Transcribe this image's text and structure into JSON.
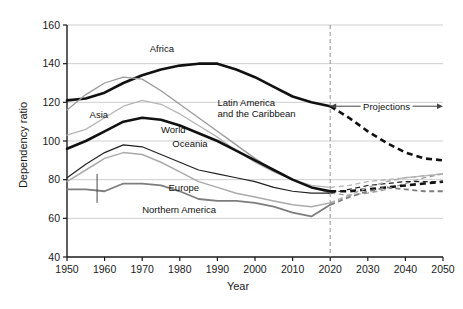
{
  "chart_data": {
    "type": "line",
    "title": "",
    "xlabel": "Year",
    "ylabel": "Dependency ratio",
    "xlim": [
      1950,
      2050
    ],
    "ylim": [
      40,
      160
    ],
    "xticks": [
      1950,
      1960,
      1970,
      1980,
      1990,
      2000,
      2010,
      2020,
      2030,
      2040,
      2050
    ],
    "yticks": [
      40,
      60,
      80,
      100,
      120,
      140,
      160
    ],
    "grid": "horizontal",
    "legend_position": "inline-labels",
    "projection_start": 2020,
    "annotations": [
      {
        "name": "projections-span",
        "text": "Projections",
        "from": 2020,
        "to": 2050,
        "y": 118,
        "arrow": "double"
      }
    ],
    "x": [
      1950,
      1955,
      1960,
      1965,
      1970,
      1975,
      1980,
      1985,
      1990,
      1995,
      2000,
      2005,
      2010,
      2015,
      2020,
      2025,
      2030,
      2035,
      2040,
      2045,
      2050
    ],
    "series": [
      {
        "name": "Africa",
        "label": "Africa",
        "color": "#111111",
        "width": 2.6,
        "label_x": 1972,
        "label_y": 146,
        "values": [
          121,
          122,
          125,
          130,
          134,
          137,
          139,
          140,
          140,
          137,
          133,
          128,
          123,
          120,
          118,
          112,
          105,
          99,
          94,
          91,
          90
        ]
      },
      {
        "name": "Latin America and the Caribbean",
        "label": "Latin America\nand the Caribbean",
        "color": "#9a9a9a",
        "width": 1.3,
        "label_x": 1990,
        "label_y": 118,
        "values": [
          116,
          124,
          130,
          133,
          132,
          126,
          119,
          112,
          105,
          98,
          91,
          85,
          80,
          76,
          73,
          72,
          73,
          75,
          78,
          81,
          83
        ]
      },
      {
        "name": "Asia",
        "label": "Asia",
        "color": "#b5b5b5",
        "width": 1.3,
        "label_x": 1956,
        "label_y": 112,
        "values": [
          103,
          106,
          112,
          118,
          121,
          119,
          114,
          108,
          102,
          95,
          89,
          84,
          80,
          77,
          76,
          77,
          79,
          80,
          81,
          82,
          83
        ]
      },
      {
        "name": "World",
        "label": "World",
        "color": "#111111",
        "width": 2.6,
        "label_x": 1975,
        "label_y": 104,
        "values": [
          96,
          100,
          105,
          110,
          112,
          111,
          108,
          104,
          100,
          95,
          90,
          85,
          80,
          76,
          74,
          74,
          75,
          76,
          77,
          78,
          79
        ]
      },
      {
        "name": "Oceania",
        "label": "Oceania",
        "color": "#222222",
        "width": 1.2,
        "label_x": 1978,
        "label_y": 97,
        "values": [
          81,
          88,
          94,
          98,
          97,
          93,
          89,
          85,
          83,
          81,
          79,
          76,
          74,
          73,
          73,
          75,
          77,
          78,
          79,
          79,
          79
        ]
      },
      {
        "name": "Europe",
        "label": "Europe",
        "color": "#aaaaaa",
        "width": 1.5,
        "label_x": 1977,
        "label_y": 74,
        "values": [
          79,
          85,
          91,
          94,
          93,
          89,
          84,
          79,
          76,
          73,
          71,
          69,
          67,
          66,
          68,
          72,
          76,
          79,
          81,
          82,
          83
        ]
      },
      {
        "name": "Northern America",
        "label": "Northern America",
        "color": "#7d7d7d",
        "width": 1.8,
        "label_x": 1970,
        "label_y": 63,
        "leader": {
          "x": 1958,
          "y_from": 68,
          "y_to": 83
        },
        "values": [
          75,
          75,
          74,
          78,
          78,
          77,
          74,
          70,
          69,
          69,
          68,
          66,
          63,
          61,
          67,
          71,
          74,
          76,
          75,
          74,
          74
        ]
      }
    ]
  },
  "axes": {
    "y_title": "Dependency ratio",
    "x_title": "Year",
    "x_tick_labels": [
      "1950",
      "1960",
      "1970",
      "1980",
      "1990",
      "2000",
      "2010",
      "2020",
      "2030",
      "2040",
      "2050"
    ],
    "y_tick_labels": [
      "40",
      "60",
      "80",
      "100",
      "120",
      "140",
      "160"
    ]
  },
  "colors": {
    "axis": "#1a1a1a",
    "grid": "#c9c9c9",
    "projection_divider": "#9a9a9a",
    "background": "#ffffff"
  }
}
